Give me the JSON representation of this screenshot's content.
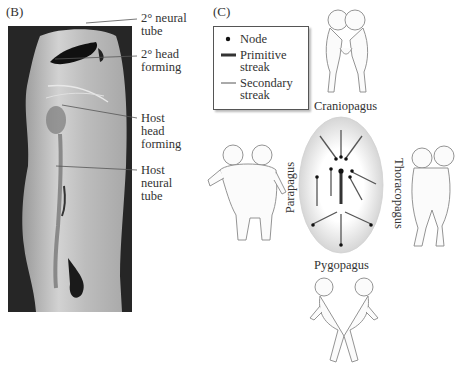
{
  "panel_b": {
    "label": "(B)",
    "photo_alt": "micrograph of chick embryo with secondary axis",
    "annotations": [
      {
        "line1": "2° neural",
        "line2": "tube"
      },
      {
        "line1": "2° head",
        "line2": "forming"
      },
      {
        "line1": "Host",
        "line2": "head",
        "line3": "forming"
      },
      {
        "line1": "Host",
        "line2": "neural",
        "line3": "tube"
      }
    ]
  },
  "panel_c": {
    "label": "(C)",
    "legend": {
      "items": [
        {
          "symbol": "dot",
          "label": "Node"
        },
        {
          "symbol": "thick-line",
          "label_line1": "Primitive",
          "label_line2": "streak"
        },
        {
          "symbol": "thin-line",
          "label_line1": "Secondary",
          "label_line2": "streak"
        }
      ]
    },
    "twin_types": {
      "top": "Craniopagus",
      "left": "Parapagus",
      "right": "Thoracopagus",
      "bottom": "Pygopagus"
    },
    "colors": {
      "primitive_streak": "#333333",
      "secondary_streak": "#555555",
      "oval_fill_edge": "#c8c8c8",
      "figure_stroke": "#888888"
    }
  }
}
